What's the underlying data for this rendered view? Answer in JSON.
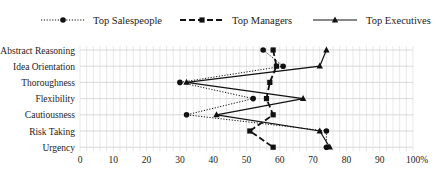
{
  "chart_data": {
    "type": "line",
    "orientation": "horizontal-categories",
    "title": "",
    "xlabel": "",
    "ylabel": "",
    "xlim": [
      0,
      100
    ],
    "x_ticks": [
      "0",
      "10",
      "20",
      "30",
      "40",
      "50",
      "60",
      "70",
      "80",
      "90",
      "100%"
    ],
    "x_tick_values": [
      0,
      10,
      20,
      30,
      40,
      50,
      60,
      70,
      80,
      90,
      100
    ],
    "grid": true,
    "legend_position": "top",
    "categories": [
      "Abstract Reasoning",
      "Idea Orientation",
      "Thoroughness",
      "Flexibility",
      "Cautiousness",
      "Risk Taking",
      "Urgency"
    ],
    "series": [
      {
        "name": "Top Salespeople",
        "style": "dotted",
        "marker": "circle",
        "values": [
          55,
          61,
          30,
          52,
          32,
          74,
          74
        ]
      },
      {
        "name": "Top Managers",
        "style": "dashed",
        "marker": "square",
        "values": [
          58,
          59,
          57,
          56,
          58,
          51,
          58
        ]
      },
      {
        "name": "Top Executives",
        "style": "solid",
        "marker": "triangle",
        "values": [
          74,
          72,
          32,
          67,
          41,
          72,
          75
        ]
      }
    ]
  },
  "colors": {
    "line": "#111111",
    "grid": "#d9d9d9",
    "text": "#222222"
  }
}
